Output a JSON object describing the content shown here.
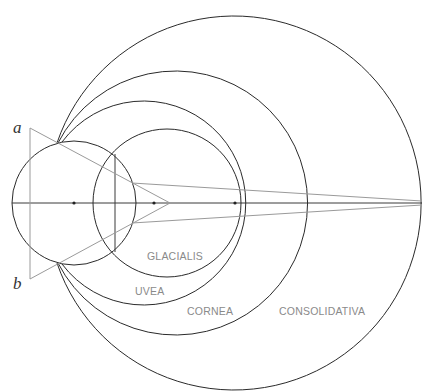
{
  "diagram": {
    "title": "",
    "colors": {
      "circle_stroke": "#2a2a2a",
      "ray_stroke": "#9a9a9a",
      "label_text": "#8a8a8a",
      "background": "#ffffff"
    },
    "points": {
      "a": "a",
      "b": "b"
    },
    "regions": [
      {
        "id": "glacialis",
        "label": "GLACIALIS"
      },
      {
        "id": "uvea",
        "label": "UVEA"
      },
      {
        "id": "cornea",
        "label": "CORNEA"
      },
      {
        "id": "consolidativa",
        "label": "CONSOLIDATIVA"
      }
    ],
    "circles": [
      {
        "id": "small-left",
        "cx": 74,
        "cy": 203,
        "r": 62
      },
      {
        "id": "glacialis",
        "cx": 167,
        "cy": 203,
        "r": 74
      },
      {
        "id": "uvea",
        "cx": 151,
        "cy": 203,
        "r": 102
      },
      {
        "id": "cornea",
        "cx": 166,
        "cy": 203,
        "r": 132
      },
      {
        "id": "consolidativa",
        "cx": 235,
        "cy": 203,
        "r": 187
      }
    ],
    "centers": [
      {
        "x": 74,
        "y": 203
      },
      {
        "x": 154,
        "y": 203
      },
      {
        "x": 235,
        "y": 203
      }
    ],
    "vertices": {
      "a": {
        "x": 30,
        "y": 128
      },
      "b": {
        "x": 30,
        "y": 279
      },
      "apex": {
        "x": 170,
        "y": 203
      },
      "far_point": {
        "x": 422,
        "y": 203
      }
    }
  }
}
